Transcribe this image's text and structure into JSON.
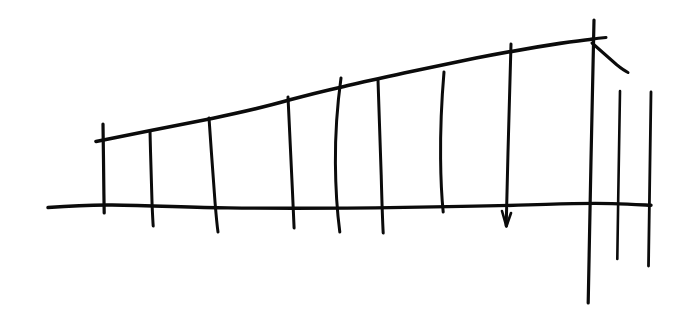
{
  "canvas": {
    "width": 697,
    "height": 331,
    "background_color": "#ffffff",
    "ink_color": "#0b0b0b",
    "medium": "hand-drawn ink line sketch",
    "subject": "fence / railing drawn in one-point perspective"
  },
  "chart_data": {
    "type": "line",
    "title": "",
    "subtitle": "",
    "xlabel": "",
    "ylabel": "",
    "xlim": [
      0,
      697
    ],
    "ylim": [
      331,
      0
    ],
    "grid": false,
    "legend": null,
    "annotations": [],
    "series": [
      {
        "name": "ground-line",
        "role": "baseline",
        "stroke_width": 3.4,
        "points": [
          [
            48,
            207
          ],
          [
            110,
            205
          ],
          [
            180,
            207
          ],
          [
            260,
            208
          ],
          [
            340,
            208
          ],
          [
            420,
            207
          ],
          [
            500,
            206
          ],
          [
            560,
            204
          ],
          [
            600,
            203
          ],
          [
            651,
            205
          ]
        ]
      },
      {
        "name": "top-rail",
        "role": "upper-rail",
        "stroke_width": 3.6,
        "points": [
          [
            96,
            141
          ],
          [
            150,
            130
          ],
          [
            208,
            119
          ],
          [
            287,
            100
          ],
          [
            339,
            88
          ],
          [
            376,
            80
          ],
          [
            442,
            66
          ],
          [
            508,
            52
          ],
          [
            560,
            44
          ],
          [
            592,
            39
          ],
          [
            605,
            38
          ]
        ]
      }
    ],
    "posts": [
      {
        "name": "post-1",
        "x_top": 103,
        "y_top": 124,
        "x_bottom": 104,
        "y_bottom": 213,
        "stroke_width": 3.2,
        "curved": false
      },
      {
        "name": "post-2",
        "x_top": 150,
        "y_top": 131,
        "x_bottom": 153,
        "y_bottom": 226,
        "stroke_width": 3.0,
        "curved": false
      },
      {
        "name": "post-3",
        "x_top": 209,
        "y_top": 118,
        "x_bottom": 218,
        "y_bottom": 232,
        "stroke_width": 3.0,
        "curved": false
      },
      {
        "name": "post-4",
        "x_top": 288,
        "y_top": 97,
        "x_bottom": 294,
        "y_bottom": 228,
        "stroke_width": 3.0,
        "curved": false
      },
      {
        "name": "post-5",
        "x_top": 341,
        "y_top": 78,
        "x_bottom": 340,
        "y_bottom": 232,
        "stroke_width": 3.0,
        "curved": true
      },
      {
        "name": "post-6",
        "x_top": 378,
        "y_top": 80,
        "x_bottom": 383,
        "y_bottom": 233,
        "stroke_width": 3.0,
        "curved": false
      },
      {
        "name": "post-7",
        "x_top": 444,
        "y_top": 72,
        "x_bottom": 443,
        "y_bottom": 212,
        "stroke_width": 3.0,
        "curved": true
      },
      {
        "name": "post-8",
        "x_top": 511,
        "y_top": 44,
        "x_bottom": 506,
        "y_bottom": 226,
        "stroke_width": 3.0,
        "curved": false,
        "arrow_tip": true
      },
      {
        "name": "post-9",
        "x_top": 594,
        "y_top": 20,
        "x_bottom": 588,
        "y_bottom": 303,
        "stroke_width": 3.2,
        "curved": false
      },
      {
        "name": "post-10",
        "x_top": 620,
        "y_top": 91,
        "x_bottom": 617,
        "y_bottom": 259,
        "stroke_width": 2.6,
        "curved": false
      },
      {
        "name": "post-11",
        "x_top": 651,
        "y_top": 92,
        "x_bottom": 648,
        "y_bottom": 266,
        "stroke_width": 2.8,
        "curved": false
      }
    ],
    "brace": {
      "name": "diagonal-brace",
      "points": [
        [
          592,
          43
        ],
        [
          610,
          58
        ],
        [
          628,
          72
        ]
      ],
      "stroke_width": 3.0
    },
    "rail_overshoot": {
      "name": "rail-tail",
      "points": [
        [
          592,
          39
        ],
        [
          606,
          37
        ]
      ],
      "stroke_width": 3.0
    }
  }
}
